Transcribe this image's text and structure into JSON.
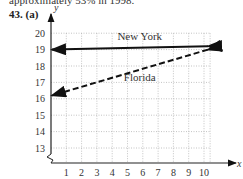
{
  "header": {
    "cut_text": "approximately 53% in 1998.",
    "problem_label": "43. (a)"
  },
  "chart_data": {
    "type": "line",
    "title": "",
    "xlabel": "x",
    "ylabel": "y",
    "x_ticks": [
      1,
      2,
      3,
      4,
      5,
      6,
      7,
      8,
      9,
      10
    ],
    "y_ticks": [
      13,
      14,
      15,
      16,
      17,
      18,
      19,
      20
    ],
    "xlim": [
      0,
      10
    ],
    "ylim": [
      12,
      20
    ],
    "axis_break": true,
    "grid": true,
    "series": [
      {
        "name": "New York",
        "style": "solid",
        "x": [
          0,
          10
        ],
        "y": [
          19.0,
          19.2
        ]
      },
      {
        "name": "Florida",
        "style": "dashed",
        "x": [
          0,
          10
        ],
        "y": [
          16.2,
          19.0
        ]
      }
    ],
    "annotations": [
      {
        "text": "New York",
        "x": 5.8,
        "y": 19.6
      },
      {
        "text": "Florida",
        "x": 5.8,
        "y": 17.1
      }
    ]
  },
  "colors": {
    "line": "#111111",
    "grid": "#aaaaaa",
    "axis": "#222222"
  }
}
